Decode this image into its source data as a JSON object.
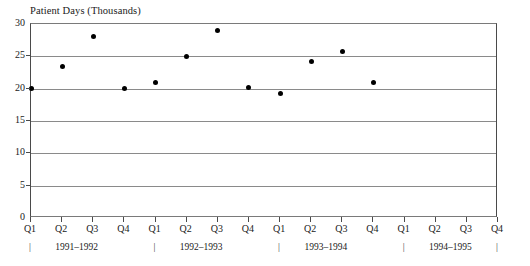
{
  "chart_data": {
    "type": "scatter",
    "title": "Patient Days (Thousands)",
    "xlabel": "",
    "ylabel": "Patient Days (Thousands)",
    "ylim": [
      0,
      30
    ],
    "grid": true,
    "legend": "none",
    "y_ticks": [
      30,
      25,
      20,
      15,
      10,
      5,
      0
    ],
    "y_tick_labels": [
      "30",
      "25",
      "20",
      "15",
      "10",
      "5",
      "0"
    ],
    "categories": [
      "Q1",
      "Q2",
      "Q3",
      "Q4",
      "Q1",
      "Q2",
      "Q3",
      "Q4",
      "Q1",
      "Q2",
      "Q3",
      "Q4",
      "Q1",
      "Q2",
      "Q3",
      "Q4"
    ],
    "year_groups": [
      {
        "label": "1991–1992",
        "start_index": 0,
        "end_index": 3
      },
      {
        "label": "1992–1993",
        "start_index": 4,
        "end_index": 7
      },
      {
        "label": "1993–1994",
        "start_index": 8,
        "end_index": 11
      },
      {
        "label": "1994–1995",
        "start_index": 12,
        "end_index": 15
      }
    ],
    "year_separator_glyph": "|",
    "points": [
      {
        "x_index": 0,
        "quarter": "Q1",
        "year": "1991–1992",
        "value": 20.0
      },
      {
        "x_index": 1,
        "quarter": "Q2",
        "year": "1991–1992",
        "value": 23.5
      },
      {
        "x_index": 2,
        "quarter": "Q3",
        "year": "1991–1992",
        "value": 28.0
      },
      {
        "x_index": 3,
        "quarter": "Q4",
        "year": "1991–1992",
        "value": 20.0
      },
      {
        "x_index": 4,
        "quarter": "Q1",
        "year": "1992–1993",
        "value": 21.0
      },
      {
        "x_index": 5,
        "quarter": "Q2",
        "year": "1992–1993",
        "value": 25.0
      },
      {
        "x_index": 6,
        "quarter": "Q3",
        "year": "1992–1993",
        "value": 29.0
      },
      {
        "x_index": 7,
        "quarter": "Q4",
        "year": "1992–1993",
        "value": 20.2
      },
      {
        "x_index": 8,
        "quarter": "Q1",
        "year": "1993–1994",
        "value": 19.2
      },
      {
        "x_index": 9,
        "quarter": "Q2",
        "year": "1993–1994",
        "value": 24.2
      },
      {
        "x_index": 10,
        "quarter": "Q3",
        "year": "1993–1994",
        "value": 25.8
      },
      {
        "x_index": 11,
        "quarter": "Q4",
        "year": "1993–1994",
        "value": 20.9
      }
    ],
    "colors": {
      "marker": "#000000",
      "gridline": "#8a8a8a",
      "axis": "#4a4a4a",
      "background": "#ffffff",
      "text": "#1a1a1a"
    }
  }
}
